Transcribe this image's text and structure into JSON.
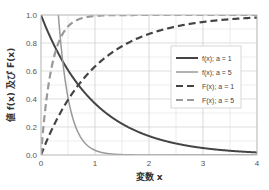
{
  "chart_data": {
    "type": "line",
    "title": "",
    "xlabel": "変数 x",
    "ylabel": "値 f(x) 及び F(x)",
    "xlim": [
      0,
      4
    ],
    "ylim": [
      0,
      1.0
    ],
    "xticks": [
      "0",
      "1",
      "2",
      "3",
      "4"
    ],
    "yticks": [
      "0.0",
      "0.2",
      "0.4",
      "0.6",
      "0.8",
      "1.0"
    ],
    "grid": true,
    "legend_position": "upper right",
    "series": [
      {
        "name": "f(x); a = 1",
        "formula": "exp(-x)",
        "style": "solid",
        "color": "#444444",
        "width": 2
      },
      {
        "name": "f(x); a = 5",
        "formula": "5*exp(-5x)",
        "style": "solid",
        "color": "#999999",
        "width": 1.5
      },
      {
        "name": "F(x); a = 1",
        "formula": "1-exp(-x)",
        "style": "dashed",
        "color": "#444444",
        "width": 2.2
      },
      {
        "name": "F(x); a = 5",
        "formula": "1-exp(-5x)",
        "style": "dashed",
        "color": "#999999",
        "width": 2.2
      }
    ],
    "x": [
      0,
      0.5,
      1,
      1.5,
      2,
      2.5,
      3,
      3.5,
      4
    ],
    "values": {
      "f_a1": [
        1.0,
        0.61,
        0.37,
        0.22,
        0.14,
        0.08,
        0.05,
        0.03,
        0.02
      ],
      "f_a5": [
        5.0,
        0.41,
        0.03,
        0.0,
        0.0,
        0.0,
        0.0,
        0.0,
        0.0
      ],
      "F_a1": [
        0.0,
        0.39,
        0.63,
        0.78,
        0.86,
        0.92,
        0.95,
        0.97,
        0.98
      ],
      "F_a5": [
        0.0,
        0.92,
        0.99,
        1.0,
        1.0,
        1.0,
        1.0,
        1.0,
        1.0
      ]
    }
  }
}
